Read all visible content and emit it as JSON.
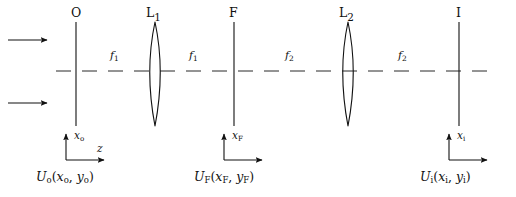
{
  "figure": {
    "background_color": "#ffffff",
    "stroke_color": "#111111",
    "width": 516,
    "height": 197
  },
  "planes": [
    {
      "id": "object",
      "label": "O",
      "sub": "",
      "x": 76,
      "field_label": "U",
      "field_sub": "o",
      "field_args": "(xₒ, yₒ)"
    },
    {
      "id": "lens1",
      "label": "L",
      "sub": "1",
      "x": 155,
      "field_label": "",
      "field_sub": "",
      "field_args": ""
    },
    {
      "id": "fourier",
      "label": "F",
      "sub": "",
      "x": 234,
      "field_label": "U",
      "field_sub": "F",
      "field_args": "(xᶠ, yᶠ)"
    },
    {
      "id": "lens2",
      "label": "L",
      "sub": "2",
      "x": 348,
      "field_label": "",
      "field_sub": "",
      "field_args": ""
    },
    {
      "id": "image",
      "label": "I",
      "sub": "",
      "x": 459,
      "field_label": "U",
      "field_sub": "i",
      "field_args": "(xᵢ, yᵢ)"
    }
  ],
  "plane_labels": {
    "object": "O",
    "lens1_base": "L",
    "lens1_sub": "1",
    "fourier": "F",
    "lens2_base": "L",
    "lens2_sub": "2",
    "image": "I"
  },
  "focal_segments": [
    {
      "id": "f1-left",
      "base": "f",
      "sub": "1",
      "from": "object",
      "to": "lens1",
      "center_x": 116,
      "y": 57
    },
    {
      "id": "f1-right",
      "base": "f",
      "sub": "1",
      "from": "lens1",
      "to": "fourier",
      "center_x": 195,
      "y": 57
    },
    {
      "id": "f2-left",
      "base": "f",
      "sub": "2",
      "from": "fourier",
      "to": "lens2",
      "center_x": 291,
      "y": 57
    },
    {
      "id": "f2-right",
      "base": "f",
      "sub": "2",
      "from": "lens2",
      "to": "image",
      "center_x": 404,
      "y": 57
    }
  ],
  "coordinate_frames": [
    {
      "id": "frame-object",
      "vertical_axis": "x",
      "vertical_sub": "o",
      "horizontal_axis": "z",
      "horizontal_sub": "",
      "origin_x": 76,
      "origin_y": 160
    },
    {
      "id": "frame-fourier",
      "vertical_axis": "x",
      "vertical_sub": "F",
      "horizontal_axis": "",
      "horizontal_sub": "",
      "origin_x": 234,
      "origin_y": 160
    },
    {
      "id": "frame-image",
      "vertical_axis": "x",
      "vertical_sub": "i",
      "horizontal_axis": "",
      "horizontal_sub": "",
      "origin_x": 459,
      "origin_y": 160
    }
  ],
  "axis_labels": {
    "x_object_base": "x",
    "x_object_sub": "o",
    "z_base": "z",
    "x_fourier_base": "x",
    "x_fourier_sub": "F",
    "x_image_base": "x",
    "x_image_sub": "i"
  },
  "field_labels": {
    "object": {
      "base": "U",
      "sub": "o",
      "open": "(",
      "arg1": "x",
      "arg1_sub": "o",
      "comma": ", ",
      "arg2": "y",
      "arg2_sub": "o",
      "close": ")"
    },
    "fourier": {
      "base": "U",
      "sub": "F",
      "open": "(",
      "arg1": "x",
      "arg1_sub": "F",
      "comma": ", ",
      "arg2": "y",
      "arg2_sub": "F",
      "close": ")"
    },
    "image": {
      "base": "U",
      "sub": "i",
      "open": "(",
      "arg1": "x",
      "arg1_sub": "i",
      "comma": ", ",
      "arg2": "y",
      "arg2_sub": "i",
      "close": ")"
    }
  },
  "input_rays": [
    {
      "id": "ray-upper",
      "x_start": 8,
      "x_end": 48,
      "y": 40,
      "direction": "right"
    },
    {
      "id": "ray-lower",
      "x_start": 8,
      "x_end": 48,
      "y": 103,
      "direction": "right"
    }
  ],
  "optical_axis": {
    "y": 71,
    "dash_pattern": "14 10",
    "x_start": 56,
    "x_end": 490
  }
}
